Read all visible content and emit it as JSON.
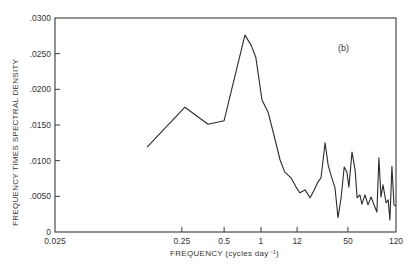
{
  "chart_data": {
    "type": "line",
    "title": "",
    "panel_label": "(b)",
    "xlabel": "FREQUENCY  (cycles day⁻¹)",
    "ylabel": "FREQUENCY TIMES SPECTRAL DENSITY",
    "ylim": [
      0,
      0.03
    ],
    "grid": false,
    "legend": null,
    "x_scale": "nonuniform (log-like)",
    "x_ticks": [
      {
        "label": "0.025",
        "value": 0.025,
        "pos": 0.0
      },
      {
        "label": "0.25",
        "value": 0.25,
        "pos": 0.372
      },
      {
        "label": "0.5",
        "value": 0.5,
        "pos": 0.496
      },
      {
        "label": "1",
        "value": 1,
        "pos": 0.604
      },
      {
        "label": "12",
        "value": 12,
        "pos": 0.71
      },
      {
        "label": "50",
        "value": 50,
        "pos": 0.859
      },
      {
        "label": "120",
        "value": 120,
        "pos": 1.0
      }
    ],
    "y_ticks": [
      {
        "label": "0",
        "value": 0
      },
      {
        "label": ".0050",
        "value": 0.005
      },
      {
        "label": ".0100",
        "value": 0.01
      },
      {
        "label": ".0150",
        "value": 0.015
      },
      {
        "label": ".0200",
        "value": 0.02
      },
      {
        "label": ".0250",
        "value": 0.025
      },
      {
        "label": ".0300",
        "value": 0.03
      }
    ],
    "series": [
      {
        "name": "spectrum",
        "points": [
          {
            "pos": 0.27,
            "y": 0.0119
          },
          {
            "pos": 0.381,
            "y": 0.0175
          },
          {
            "pos": 0.449,
            "y": 0.0151
          },
          {
            "pos": 0.496,
            "y": 0.0156
          },
          {
            "pos": 0.557,
            "y": 0.0276
          },
          {
            "pos": 0.575,
            "y": 0.0262
          },
          {
            "pos": 0.589,
            "y": 0.0245
          },
          {
            "pos": 0.607,
            "y": 0.0185
          },
          {
            "pos": 0.625,
            "y": 0.0168
          },
          {
            "pos": 0.642,
            "y": 0.0136
          },
          {
            "pos": 0.66,
            "y": 0.0101
          },
          {
            "pos": 0.674,
            "y": 0.0084
          },
          {
            "pos": 0.692,
            "y": 0.0076
          },
          {
            "pos": 0.707,
            "y": 0.0063
          },
          {
            "pos": 0.718,
            "y": 0.0055
          },
          {
            "pos": 0.733,
            "y": 0.0059
          },
          {
            "pos": 0.748,
            "y": 0.0048
          },
          {
            "pos": 0.76,
            "y": 0.0059
          },
          {
            "pos": 0.771,
            "y": 0.007
          },
          {
            "pos": 0.78,
            "y": 0.0076
          },
          {
            "pos": 0.792,
            "y": 0.0125
          },
          {
            "pos": 0.801,
            "y": 0.0094
          },
          {
            "pos": 0.809,
            "y": 0.008
          },
          {
            "pos": 0.821,
            "y": 0.0062
          },
          {
            "pos": 0.83,
            "y": 0.002
          },
          {
            "pos": 0.839,
            "y": 0.0048
          },
          {
            "pos": 0.848,
            "y": 0.0091
          },
          {
            "pos": 0.856,
            "y": 0.0084
          },
          {
            "pos": 0.862,
            "y": 0.0063
          },
          {
            "pos": 0.871,
            "y": 0.0112
          },
          {
            "pos": 0.88,
            "y": 0.0087
          },
          {
            "pos": 0.886,
            "y": 0.0048
          },
          {
            "pos": 0.894,
            "y": 0.0052
          },
          {
            "pos": 0.9,
            "y": 0.0039
          },
          {
            "pos": 0.909,
            "y": 0.0052
          },
          {
            "pos": 0.918,
            "y": 0.0038
          },
          {
            "pos": 0.927,
            "y": 0.0049
          },
          {
            "pos": 0.935,
            "y": 0.0039
          },
          {
            "pos": 0.944,
            "y": 0.0028
          },
          {
            "pos": 0.95,
            "y": 0.0104
          },
          {
            "pos": 0.956,
            "y": 0.0049
          },
          {
            "pos": 0.962,
            "y": 0.0066
          },
          {
            "pos": 0.971,
            "y": 0.0041
          },
          {
            "pos": 0.977,
            "y": 0.0045
          },
          {
            "pos": 0.982,
            "y": 0.0017
          },
          {
            "pos": 0.988,
            "y": 0.0092
          },
          {
            "pos": 0.994,
            "y": 0.0038
          },
          {
            "pos": 1.0,
            "y": 0.0036
          }
        ]
      }
    ]
  },
  "style": {
    "line_color": "#2b2b2b",
    "axis_color": "#3a3a3a",
    "background": "#ffffff"
  },
  "layout": {
    "plot_left": 55,
    "plot_right": 396,
    "plot_top": 18,
    "plot_bottom": 232
  }
}
